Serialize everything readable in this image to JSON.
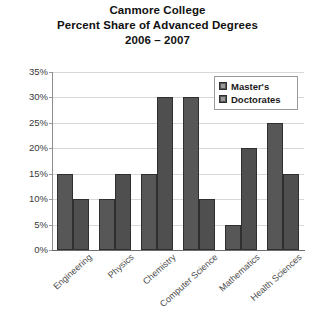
{
  "chart_data": {
    "type": "bar",
    "title": "Canmore College Percent Share of Advanced Degrees 2006 – 2007",
    "title_lines": [
      "Canmore College",
      "Percent Share of Advanced Degrees",
      "2006 – 2007"
    ],
    "xlabel": "",
    "ylabel": "",
    "ylim": [
      0,
      35
    ],
    "ytick_step": 5,
    "ytick_labels": [
      "0%",
      "5%",
      "10%",
      "15%",
      "20%",
      "25%",
      "30%",
      "35%"
    ],
    "ytick_values": [
      0,
      5,
      10,
      15,
      20,
      25,
      30,
      35
    ],
    "grid": true,
    "legend_position": "upper-right",
    "categories": [
      "Engineering",
      "Physics",
      "Chemistry",
      "Computer Science",
      "Mathematics",
      "Health Sciences"
    ],
    "series": [
      {
        "name": "Master's",
        "color": "#575757",
        "values": [
          15,
          10,
          15,
          30,
          5,
          25
        ]
      },
      {
        "name": "Doctorates",
        "color": "#4f4f4f",
        "values": [
          10,
          15,
          30,
          10,
          20,
          15
        ]
      }
    ]
  },
  "legend": {
    "entries": [
      "Master's",
      "Doctorates"
    ]
  },
  "colors": {
    "bar_fill": "#545454",
    "bar_edge": "#2f2f2f",
    "gridline": "#d8d8d8",
    "axis": "#6d6d6d",
    "background": "#ffffff",
    "text": "#111111"
  }
}
